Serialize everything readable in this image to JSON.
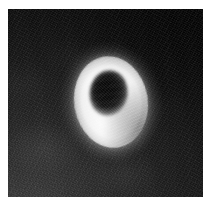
{
  "figure": {
    "kind": "grayscale-micrograph",
    "subject": "red blood cell (erythrocyte)",
    "modality": "electron micrograph",
    "has_scale_bar": false,
    "has_caption_text": false,
    "has_annotation_labels": false,
    "width_px": 216,
    "height_px": 207
  },
  "page": {
    "margin_color": "#ffffff",
    "margin_left_px": 8,
    "margin_top_px": 9,
    "margin_right_px": 13,
    "margin_bottom_px": 10
  },
  "plate": {
    "name": "micrograph-plate",
    "left_px": 8,
    "top_px": 9,
    "width_px": 195,
    "height_px": 188,
    "background_color": "#141414",
    "darkest_corner": "top-right",
    "lightest_corner": "bottom-left",
    "texture": "fine photographic / electron-detector grain",
    "background_tone_range": [
      "#070707",
      "#3a3a3a"
    ]
  },
  "specimen": {
    "name": "erythrocyte",
    "shape": "biconcave disc",
    "orientation": "face-on, tilted",
    "rotation_deg": -9,
    "bounding_box": {
      "left_px": 74,
      "top_px": 56,
      "width_px": 74,
      "height_px": 92
    },
    "center_px": {
      "x": 111,
      "y": 102
    },
    "rim": {
      "name": "raised-torus-rim",
      "description": "bright raised annular margin of the cell",
      "tone": "#eeeeee",
      "highlight_tone": "#ffffff",
      "highlight_position": "lower-left",
      "shadow_tone": "#8e8e8e",
      "shadow_position": "lower-right"
    },
    "central_depression": {
      "name": "central-pallor-pit",
      "description": "dark concave centre of the biconcave disc",
      "shape": "ellipse",
      "rotation_deg": 16,
      "bounding_box": {
        "left_px": 95,
        "top_px": 73,
        "width_px": 38,
        "height_px": 46
      },
      "core_tone": "#070707",
      "edge_tone": "#3a3a3a"
    },
    "halo": {
      "name": "scatter-halo",
      "description": "soft bright scatter fringe surrounding the cell",
      "tone": "rgba(255,255,255,0.30)"
    }
  },
  "colors": {
    "paper": "#ffffff",
    "field_dark": "#0a0a0a",
    "field_mid": "#2b2b2b",
    "cell_bright": "#eeeeee",
    "cell_white": "#ffffff",
    "pit_dark": "#070707"
  }
}
